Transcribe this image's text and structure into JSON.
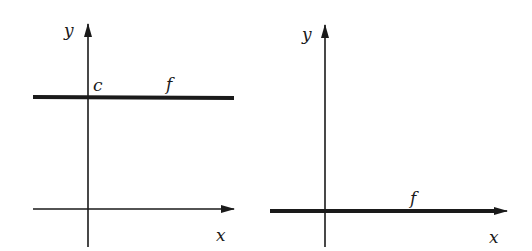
{
  "figure": {
    "panels": [
      {
        "id": "left",
        "function_label": "f",
        "intercept_label": "c",
        "x_axis_label": "x",
        "y_axis_label": "y",
        "description": "constant function f(x) = c, horizontal line above x-axis"
      },
      {
        "id": "right",
        "function_label": "f",
        "x_axis_label": "x",
        "y_axis_label": "y",
        "description": "zero function f(x) = 0, line coincides with x-axis"
      }
    ],
    "colors": {
      "ink": "#1a1a1a",
      "background": "#ffffff"
    }
  }
}
